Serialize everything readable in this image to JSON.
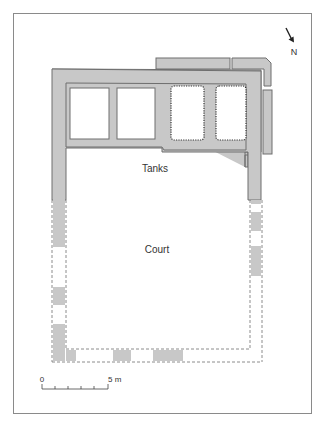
{
  "figure": {
    "type": "architectural plan",
    "labels": {
      "tanks": "Tanks",
      "court": "Court"
    },
    "north_arrow": {
      "label": "N"
    },
    "scale_bar": {
      "start_label": "0",
      "end_label": "5 m"
    }
  },
  "colors": {
    "wall_fill": "#c8c8c8",
    "wall_stroke": "#6e6e6e",
    "frame": "#8a8a8a",
    "text": "#333333"
  }
}
